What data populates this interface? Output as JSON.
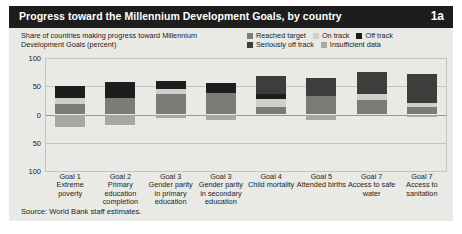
{
  "figure": {
    "title": "Progress toward the Millennium Development Goals, by country",
    "badge": "1a",
    "axis_caption": "Share of countries making progress toward Millennium Development Goals (percent)",
    "source": "Source: World Bank staff estimates."
  },
  "colors": {
    "title_bar": "#1d1d1d",
    "card_bg": "#e9e9e6",
    "reached_target": "#7b7b78",
    "on_track": "#cfcfca",
    "off_track": "#1d1d1d",
    "seriously_off_track": "#3d3d3b",
    "insufficient_data": "#a8a8a3",
    "gridline": "#c5c5c0"
  },
  "legend": {
    "rows": [
      [
        {
          "label": "Reached target",
          "key": "reached_target"
        },
        {
          "label": "On track",
          "key": "on_track"
        },
        {
          "label": "Off track",
          "key": "off_track"
        }
      ],
      [
        {
          "label": "Seriously off track",
          "key": "seriously_off_track"
        },
        {
          "label": "Insufficient data",
          "key": "insufficient_data"
        }
      ]
    ]
  },
  "chart_data": {
    "type": "bar",
    "title": "Progress toward the Millennium Development Goals, by country",
    "xlabel": "",
    "ylabel": "Share of countries making progress toward Millennium Development Goals (percent)",
    "ylim": [
      -100,
      100
    ],
    "yticks": [
      100,
      50,
      0,
      50,
      100
    ],
    "grid": true,
    "legend_position": "top-right",
    "stacked": true,
    "diverging": true,
    "note": "Positive segments stack upward from 0; insufficient-data segment extends downward below 0.",
    "categories": [
      {
        "goal": "Goal 1",
        "name": "Extreme poverty"
      },
      {
        "goal": "Goal 2",
        "name": "Primary education completion"
      },
      {
        "goal": "Goal 3",
        "name": "Gender parity in primary education"
      },
      {
        "goal": "Goal 3",
        "name": "Gender parity in secondary education"
      },
      {
        "goal": "Goal 4",
        "name": "Child mortality"
      },
      {
        "goal": "Goal 5",
        "name": "Attended births"
      },
      {
        "goal": "Goal 7",
        "name": "Access to safe water"
      },
      {
        "goal": "Goal 7",
        "name": "Access to sanitation"
      }
    ],
    "series": [
      {
        "name": "Reached target",
        "key": "reached_target",
        "values": [
          18,
          30,
          36,
          38,
          13,
          33,
          26,
          13
        ]
      },
      {
        "name": "On track",
        "key": "on_track",
        "values": [
          12,
          0,
          9,
          0,
          14,
          0,
          11,
          8
        ]
      },
      {
        "name": "Off track",
        "key": "off_track",
        "values": [
          20,
          27,
          15,
          17,
          10,
          0,
          0,
          0
        ]
      },
      {
        "name": "Seriously off track",
        "key": "seriously_off_track",
        "values": [
          0,
          0,
          0,
          0,
          32,
          31,
          39,
          51
        ]
      },
      {
        "name": "Insufficient data",
        "key": "insufficient_data",
        "values": [
          -22,
          -19,
          -7,
          -9,
          0,
          -10,
          0,
          -5
        ]
      }
    ]
  },
  "xaxis_labels": [
    {
      "goal": "Goal 1",
      "desc": "Extreme poverty"
    },
    {
      "goal": "Goal 2",
      "desc": "Primary education completion"
    },
    {
      "goal": "Goal 3",
      "desc": "Gender parity in primary education"
    },
    {
      "goal": "Goal 3",
      "desc": "Gender parity in secondary education"
    },
    {
      "goal": "Goal 4",
      "desc": "Child mortality"
    },
    {
      "goal": "Goal 5",
      "desc": "Attended births"
    },
    {
      "goal": "Goal 7",
      "desc": "Access to safe water"
    },
    {
      "goal": "Goal 7",
      "desc": "Access to sanitation"
    }
  ]
}
